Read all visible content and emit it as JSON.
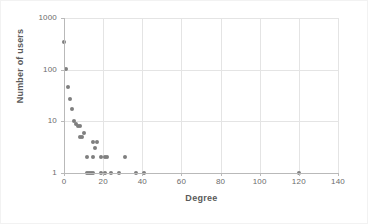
{
  "chart_data": {
    "type": "scatter",
    "title": "",
    "xlabel": "Degree",
    "ylabel": "Number of users",
    "xlim": [
      0,
      140
    ],
    "ylim": [
      1,
      1000
    ],
    "yscale": "log",
    "xscale": "linear",
    "grid": true,
    "legend": false,
    "marker_color": "#7f7f7f",
    "xticks": [
      0,
      20,
      40,
      60,
      80,
      100,
      120,
      140
    ],
    "xtick_labels": [
      "0",
      "20",
      "40",
      "60",
      "80",
      "100",
      "120",
      "140"
    ],
    "yticks": [
      1,
      10,
      100,
      1000
    ],
    "ytick_labels": [
      "1",
      "10",
      "100",
      "1000"
    ],
    "points": [
      {
        "x": 0,
        "y": 350
      },
      {
        "x": 1,
        "y": 105
      },
      {
        "x": 2,
        "y": 47
      },
      {
        "x": 3,
        "y": 27
      },
      {
        "x": 4,
        "y": 17
      },
      {
        "x": 5,
        "y": 10
      },
      {
        "x": 6,
        "y": 9
      },
      {
        "x": 7,
        "y": 8
      },
      {
        "x": 8,
        "y": 8
      },
      {
        "x": 8,
        "y": 5
      },
      {
        "x": 9,
        "y": 5
      },
      {
        "x": 10,
        "y": 6
      },
      {
        "x": 15,
        "y": 4
      },
      {
        "x": 16,
        "y": 3
      },
      {
        "x": 17,
        "y": 4
      },
      {
        "x": 12,
        "y": 2
      },
      {
        "x": 15,
        "y": 2
      },
      {
        "x": 19,
        "y": 2
      },
      {
        "x": 21,
        "y": 2
      },
      {
        "x": 22,
        "y": 2
      },
      {
        "x": 31,
        "y": 2
      },
      {
        "x": 12,
        "y": 1
      },
      {
        "x": 13,
        "y": 1
      },
      {
        "x": 14,
        "y": 1
      },
      {
        "x": 15,
        "y": 1
      },
      {
        "x": 19,
        "y": 1
      },
      {
        "x": 21,
        "y": 1
      },
      {
        "x": 24,
        "y": 1
      },
      {
        "x": 28,
        "y": 1
      },
      {
        "x": 37,
        "y": 1
      },
      {
        "x": 41,
        "y": 1
      },
      {
        "x": 120,
        "y": 1
      }
    ]
  }
}
